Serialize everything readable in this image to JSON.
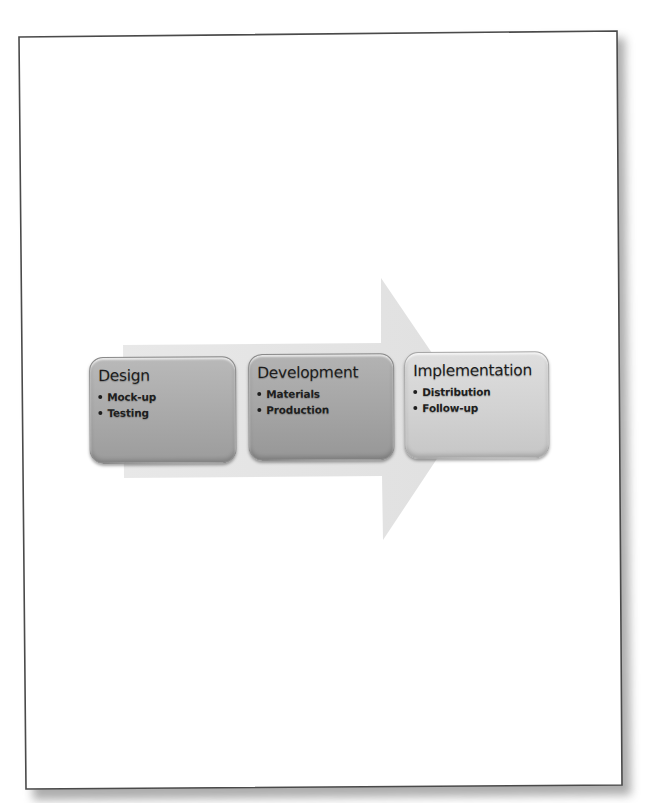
{
  "diagram": {
    "type": "process-arrow",
    "colors": {
      "page_background": "#ffffff",
      "page_border": "#555555",
      "arrow_fill": "#e3e3e3",
      "box_design": "#aeaeae",
      "box_development": "#a8a8a8",
      "box_implementation": "#d4d4d4",
      "text": "#1c1c1c"
    },
    "steps": [
      {
        "title": "Design",
        "items": [
          "Mock-up",
          "Testing"
        ]
      },
      {
        "title": "Development",
        "items": [
          "Materials",
          "Production"
        ]
      },
      {
        "title": "Implementation",
        "items": [
          "Distribution",
          "Follow-up"
        ]
      }
    ]
  }
}
